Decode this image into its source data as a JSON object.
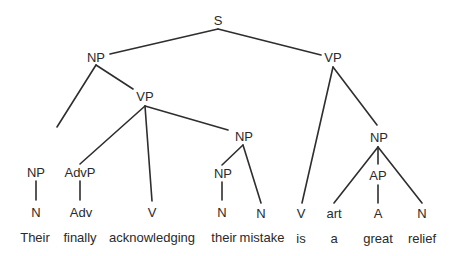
{
  "diagram": {
    "type": "syntax-tree",
    "nodes": {
      "S": "S",
      "NP_subj": "NP",
      "VP_main": "VP",
      "VP_inner": "VP",
      "NP_poss": "NP",
      "AdvP": "AdvP",
      "NP_obj": "NP",
      "NP_det": "NP",
      "NP_pred": "NP",
      "AP": "AP",
      "N_their": "N",
      "Adv": "Adv",
      "V_ack": "V",
      "N_their2": "N",
      "N_mistake": "N",
      "V_is": "V",
      "art": "art",
      "A": "A",
      "N_relief": "N"
    },
    "words": [
      "Their",
      "finally",
      "acknowledging",
      "their",
      "mistake",
      "is",
      "a",
      "great",
      "relief"
    ]
  }
}
